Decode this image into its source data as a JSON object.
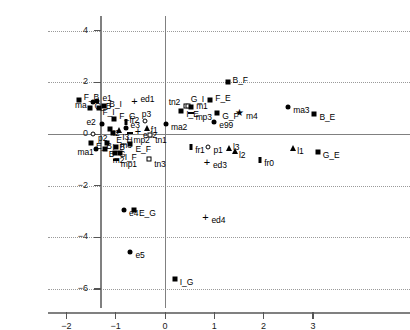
{
  "chart_data": {
    "type": "scatter",
    "title": "",
    "xlabel": "",
    "ylabel": "",
    "xlim": [
      -2.35,
      3.6
    ],
    "ylim": [
      -6.4,
      4.6
    ],
    "xticks": [
      -2,
      -1,
      0,
      1,
      2,
      3
    ],
    "yticks": [
      4,
      2,
      0,
      -2,
      -4,
      -6
    ],
    "grid": true,
    "grid_style": "dotted-horizontal",
    "axis_lines": [
      "x=0 vertical",
      "y=0 horizontal"
    ],
    "marker_kinds": [
      "filled-square",
      "filled-circle",
      "open-circle",
      "open-square",
      "filled-triangle",
      "star",
      "plus",
      "dash",
      "vertical-bar"
    ],
    "points": [
      {
        "label": "F_B",
        "x": -1.75,
        "y": 1.3,
        "marker": "filled-square",
        "lx": 5,
        "ly": -4
      },
      {
        "label": "ma",
        "x": -1.46,
        "y": 1.22,
        "marker": "filled-circle",
        "lx": -18,
        "ly": 2
      },
      {
        "label": "e1",
        "x": -1.37,
        "y": 1.29,
        "marker": "filled-circle",
        "lx": 5,
        "ly": -4
      },
      {
        "label": "G_B",
        "x": -1.53,
        "y": 1.02,
        "marker": "filled-square",
        "lx": 5,
        "ly": -3
      },
      {
        "label": "F_I",
        "x": -1.33,
        "y": 0.99,
        "marker": "filled-square",
        "lx": 3,
        "ly": 3
      },
      {
        "label": "B_I",
        "x": -1.23,
        "y": 1.07,
        "marker": "filled-square",
        "lx": 5,
        "ly": -3
      },
      {
        "label": "ed1",
        "x": -0.62,
        "y": 1.29,
        "marker": "plus",
        "lx": 6,
        "ly": -3
      },
      {
        "label": "F_G",
        "x": -1.03,
        "y": 0.6,
        "marker": "filled-square",
        "lx": 5,
        "ly": -4
      },
      {
        "label": "fr2",
        "x": -0.8,
        "y": 0.47,
        "marker": "vertical-bar",
        "lx": 4,
        "ly": -3
      },
      {
        "label": "e2",
        "x": -1.27,
        "y": 0.38,
        "marker": "filled-circle",
        "lx": -16,
        "ly": -3
      },
      {
        "label": "I2",
        "x": -1.12,
        "y": 0.21,
        "marker": "filled-square",
        "lx": 3,
        "ly": 3
      },
      {
        "label": "I3",
        "x": -0.93,
        "y": 0.15,
        "marker": "filled-triangle",
        "lx": 3,
        "ly": 6
      },
      {
        "label": "e3",
        "x": -0.8,
        "y": 0.22,
        "marker": "filled-circle",
        "lx": 5,
        "ly": 0
      },
      {
        "label": "E_H",
        "x": -1.05,
        "y": 0.02,
        "marker": "filled-square",
        "lx": 3,
        "ly": 6
      },
      {
        "label": "mp2",
        "x": -0.7,
        "y": 0.05,
        "marker": "dash",
        "lx": 3,
        "ly": 6
      },
      {
        "label": "ed2",
        "x": -0.55,
        "y": 0.13,
        "marker": "plus",
        "lx": 5,
        "ly": 3
      },
      {
        "label": "p2",
        "x": -1.46,
        "y": 0.0,
        "marker": "open-circle",
        "lx": 5,
        "ly": 3
      },
      {
        "label": "p3",
        "x": -0.41,
        "y": 0.5,
        "marker": "open-circle",
        "lx": -3,
        "ly": -8
      },
      {
        "label": "f1",
        "x": -0.37,
        "y": 0.25,
        "marker": "filled-triangle",
        "lx": 4,
        "ly": 1
      },
      {
        "label": "tn1",
        "x": -0.3,
        "y": -0.04,
        "marker": "open-square",
        "lx": 5,
        "ly": 4
      },
      {
        "label": "E_B",
        "x": -1.5,
        "y": -0.33,
        "marker": "filled-square",
        "lx": 5,
        "ly": 2
      },
      {
        "label": "I_B",
        "x": -1.17,
        "y": -0.35,
        "marker": "filled-square",
        "lx": 5,
        "ly": 3
      },
      {
        "label": "E_F",
        "x": -0.7,
        "y": -0.38,
        "marker": "filled-square",
        "lx": 5,
        "ly": 4
      },
      {
        "label": "ma1",
        "x": -1.39,
        "y": -0.6,
        "marker": "filled-circle",
        "lx": -19,
        "ly": 2
      },
      {
        "label": "B_G",
        "x": -1.22,
        "y": -0.58,
        "marker": "filled-square",
        "lx": 4,
        "ly": 4
      },
      {
        "label": "m3",
        "x": -0.99,
        "y": -0.52,
        "marker": "filled-square",
        "lx": 4,
        "ly": -3
      },
      {
        "label": "m2",
        "x": -1.02,
        "y": -0.74,
        "marker": "filled-square",
        "lx": -2,
        "ly": 6
      },
      {
        "label": "I_F",
        "x": -0.92,
        "y": -0.74,
        "marker": "filled-square",
        "lx": 5,
        "ly": 3
      },
      {
        "label": "mp1",
        "x": -1.0,
        "y": -1.02,
        "marker": "dash",
        "lx": 5,
        "ly": 3
      },
      {
        "label": "tn3",
        "x": -0.32,
        "y": -0.98,
        "marker": "open-square",
        "lx": 5,
        "ly": 4
      },
      {
        "label": "B_F",
        "x": 1.27,
        "y": 2.0,
        "marker": "filled-square",
        "lx": 5,
        "ly": -3
      },
      {
        "label": "F_E",
        "x": 0.92,
        "y": 1.32,
        "marker": "filled-square",
        "lx": 5,
        "ly": -3
      },
      {
        "label": "tn2",
        "x": 0.42,
        "y": 1.1,
        "marker": "open-square",
        "lx": -17,
        "ly": -5
      },
      {
        "label": "G_I",
        "x": 0.46,
        "y": 1.1,
        "marker": "open-square",
        "lx": 3,
        "ly": -8
      },
      {
        "label": "m1",
        "x": 0.53,
        "y": 1.03,
        "marker": "filled-square",
        "lx": 5,
        "ly": -2
      },
      {
        "label": "I_E",
        "x": 0.33,
        "y": 0.9,
        "marker": "filled-square",
        "lx": 5,
        "ly": 2
      },
      {
        "label": "mp3",
        "x": 0.52,
        "y": 0.8,
        "marker": "dash",
        "lx": 5,
        "ly": 3
      },
      {
        "label": "G_F",
        "x": 1.06,
        "y": 0.82,
        "marker": "filled-square",
        "lx": 5,
        "ly": 2
      },
      {
        "label": "m4",
        "x": 1.52,
        "y": 0.8,
        "marker": "star",
        "lx": 6,
        "ly": 2
      },
      {
        "label": "ma3",
        "x": 2.5,
        "y": 1.05,
        "marker": "filled-circle",
        "lx": 5,
        "ly": 2
      },
      {
        "label": "B_E",
        "x": 3.03,
        "y": 0.78,
        "marker": "filled-square",
        "lx": 5,
        "ly": 2
      },
      {
        "label": "ma2",
        "x": 0.02,
        "y": 0.4,
        "marker": "filled-circle",
        "lx": 5,
        "ly": 2
      },
      {
        "label": "e99",
        "x": 1.0,
        "y": 0.45,
        "marker": "filled-circle",
        "lx": 5,
        "ly": 2
      },
      {
        "label": "fr1",
        "x": 0.53,
        "y": -0.52,
        "marker": "vertical-bar",
        "lx": 4,
        "ly": 2
      },
      {
        "label": "p1",
        "x": 0.88,
        "y": -0.49,
        "marker": "open-circle",
        "lx": 5,
        "ly": 2
      },
      {
        "label": "l3",
        "x": 1.3,
        "y": -0.55,
        "marker": "filled-triangle",
        "lx": 4,
        "ly": -2
      },
      {
        "label": "l2",
        "x": 1.42,
        "y": -0.66,
        "marker": "filled-triangle",
        "lx": 4,
        "ly": 3
      },
      {
        "label": "l1",
        "x": 2.6,
        "y": -0.55,
        "marker": "filled-triangle",
        "lx": 4,
        "ly": 2
      },
      {
        "label": "G_E",
        "x": 3.1,
        "y": -0.7,
        "marker": "filled-square",
        "lx": 5,
        "ly": 2
      },
      {
        "label": "fr0",
        "x": 1.93,
        "y": -1.02,
        "marker": "vertical-bar",
        "lx": 4,
        "ly": 2
      },
      {
        "label": "ed3",
        "x": 0.85,
        "y": -1.1,
        "marker": "plus",
        "lx": 6,
        "ly": 2
      },
      {
        "label": "e4",
        "x": -0.83,
        "y": -2.95,
        "marker": "filled-circle",
        "lx": 5,
        "ly": 2
      },
      {
        "label": "E_G",
        "x": -0.63,
        "y": -2.95,
        "marker": "filled-square",
        "lx": 5,
        "ly": 2
      },
      {
        "label": "ed4",
        "x": 0.82,
        "y": -3.2,
        "marker": "plus",
        "lx": 6,
        "ly": 2
      },
      {
        "label": "e5",
        "x": -0.7,
        "y": -4.55,
        "marker": "filled-circle",
        "lx": 5,
        "ly": 2
      },
      {
        "label": "I_G",
        "x": 0.2,
        "y": -5.6,
        "marker": "filled-square",
        "lx": 5,
        "ly": 2
      }
    ]
  }
}
